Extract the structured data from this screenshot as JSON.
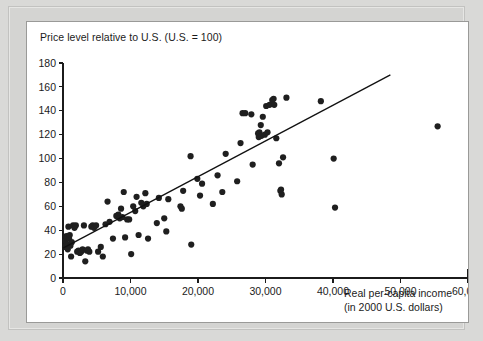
{
  "panel": {
    "background_color": "#ffffff",
    "border_color": "#9a9a98",
    "page_background_color": "#d9d9d7"
  },
  "chart_data": {
    "type": "scatter",
    "title": "Price level relative to U.S. (U.S. = 100)",
    "subtitle": "",
    "xlabel_line1": "Real per-capita income",
    "xlabel_line2": "(in 2000 U.S. dollars)",
    "ylabel": "Price level relative to U.S. (U.S. = 100)",
    "xlim": [
      0,
      60000
    ],
    "ylim": [
      0,
      180
    ],
    "xticks": [
      0,
      10000,
      20000,
      30000,
      40000,
      50000,
      60000
    ],
    "xtick_labels": [
      "0",
      "10,000",
      "20,000",
      "30,000",
      "40,000",
      "50,000",
      "60,000"
    ],
    "yticks": [
      0,
      20,
      40,
      60,
      80,
      100,
      120,
      140,
      160,
      180
    ],
    "ytick_labels": [
      "0",
      "20",
      "40",
      "60",
      "80",
      "100",
      "120",
      "140",
      "160",
      "180"
    ],
    "grid": false,
    "legend": false,
    "marker_color": "#1f1f1f",
    "marker_size": 3.1,
    "trend_line": {
      "name": "fitted regression line",
      "color": "#111111",
      "x_start": 0,
      "y_start": 25,
      "x_end": 48500,
      "y_end": 170
    },
    "points": [
      [
        300,
        26
      ],
      [
        400,
        31
      ],
      [
        500,
        35
      ],
      [
        600,
        28
      ],
      [
        700,
        24
      ],
      [
        800,
        43
      ],
      [
        900,
        33
      ],
      [
        1000,
        36
      ],
      [
        1100,
        27
      ],
      [
        1200,
        18
      ],
      [
        1300,
        30
      ],
      [
        1500,
        44
      ],
      [
        1700,
        42
      ],
      [
        1900,
        44
      ],
      [
        2100,
        22
      ],
      [
        2300,
        23
      ],
      [
        2500,
        21
      ],
      [
        2700,
        22
      ],
      [
        2900,
        24
      ],
      [
        3100,
        44
      ],
      [
        3300,
        14
      ],
      [
        3500,
        23
      ],
      [
        3700,
        24
      ],
      [
        3900,
        22
      ],
      [
        4200,
        43
      ],
      [
        4400,
        44
      ],
      [
        4600,
        42
      ],
      [
        4900,
        44
      ],
      [
        5200,
        22
      ],
      [
        5600,
        26
      ],
      [
        5900,
        18
      ],
      [
        6300,
        45
      ],
      [
        6600,
        64
      ],
      [
        6900,
        47
      ],
      [
        7400,
        33
      ],
      [
        7900,
        52
      ],
      [
        8200,
        53
      ],
      [
        8400,
        50
      ],
      [
        8600,
        58
      ],
      [
        8800,
        51
      ],
      [
        9000,
        72
      ],
      [
        9200,
        34
      ],
      [
        9500,
        49
      ],
      [
        9800,
        49
      ],
      [
        10100,
        20
      ],
      [
        10400,
        60
      ],
      [
        10700,
        56
      ],
      [
        10900,
        68
      ],
      [
        11200,
        36
      ],
      [
        11600,
        63
      ],
      [
        11900,
        60
      ],
      [
        12200,
        71
      ],
      [
        12400,
        62
      ],
      [
        12600,
        33
      ],
      [
        13900,
        46
      ],
      [
        14200,
        67
      ],
      [
        15000,
        50
      ],
      [
        15300,
        39
      ],
      [
        15600,
        66
      ],
      [
        17400,
        60
      ],
      [
        17600,
        58
      ],
      [
        17800,
        73
      ],
      [
        18900,
        102
      ],
      [
        19000,
        28
      ],
      [
        19900,
        83
      ],
      [
        20300,
        69
      ],
      [
        20600,
        79
      ],
      [
        22200,
        62
      ],
      [
        22900,
        86
      ],
      [
        23600,
        72
      ],
      [
        24100,
        104
      ],
      [
        25800,
        81
      ],
      [
        26300,
        113
      ],
      [
        26600,
        138
      ],
      [
        27000,
        138
      ],
      [
        27900,
        137
      ],
      [
        28100,
        95
      ],
      [
        28900,
        121
      ],
      [
        29000,
        118
      ],
      [
        29100,
        122
      ],
      [
        29300,
        128
      ],
      [
        29400,
        119
      ],
      [
        29600,
        135
      ],
      [
        29900,
        120
      ],
      [
        30100,
        144
      ],
      [
        30300,
        122
      ],
      [
        30600,
        145
      ],
      [
        31000,
        149
      ],
      [
        31200,
        150
      ],
      [
        31300,
        145
      ],
      [
        31600,
        117
      ],
      [
        32000,
        96
      ],
      [
        32200,
        73
      ],
      [
        32300,
        74
      ],
      [
        32400,
        70
      ],
      [
        32600,
        101
      ],
      [
        33100,
        151
      ],
      [
        38200,
        148
      ],
      [
        40100,
        100
      ],
      [
        40300,
        59
      ],
      [
        55500,
        127
      ]
    ]
  }
}
